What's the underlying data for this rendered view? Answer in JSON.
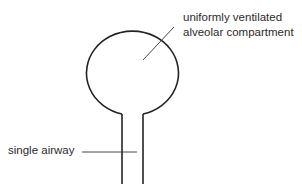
{
  "diagram": {
    "labels": {
      "compartment_line1": "uniformly ventilated",
      "compartment_line2": "alveolar compartment",
      "airway": "single airway"
    },
    "colors": {
      "stroke": "#222222",
      "background": "#ffffff"
    }
  }
}
